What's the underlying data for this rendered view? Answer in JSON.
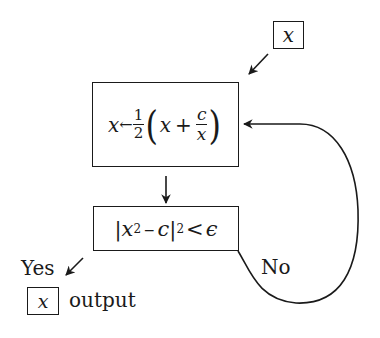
{
  "diagram": {
    "type": "flowchart",
    "input_box": {
      "label": "x"
    },
    "update_box": {
      "lhs": "x",
      "assign": "←",
      "half_num": "1",
      "half_den": "2",
      "open_paren": "(",
      "term1": "x",
      "plus": "+",
      "c_num": "c",
      "x_den": "x",
      "close_paren": ")"
    },
    "test_box": {
      "bar_open": "|",
      "x": "x",
      "sq": "2",
      "minus": "–",
      "c": "c",
      "bar_close": "|",
      "sq2": "2",
      "lt": "<",
      "eps": "ϵ"
    },
    "yes_label": "Yes",
    "no_label": "No",
    "output_box": {
      "label": "x"
    },
    "output_label": "output",
    "colors": {
      "ink": "#1a1a1a",
      "background": "#ffffff"
    }
  }
}
